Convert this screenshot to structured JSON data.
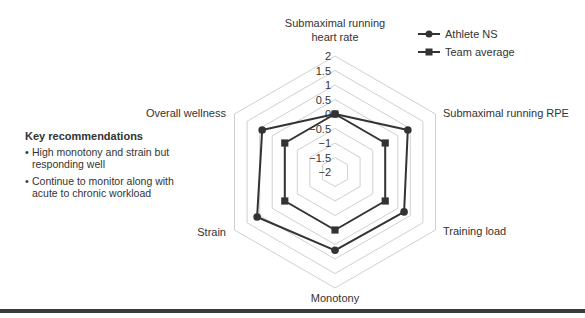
{
  "chart_data": {
    "type": "radar",
    "title": "",
    "axes": [
      "Submaximal running heart rate",
      "Submaximal running RPE",
      "Training load",
      "Monotony",
      "Strain",
      "Overall wellness"
    ],
    "axis_label_lines": [
      [
        "Submaximal running",
        "heart rate"
      ],
      [
        "Submaximal running RPE"
      ],
      [
        "Training load"
      ],
      [
        "Monotony"
      ],
      [
        "Strain"
      ],
      [
        "Overall wellness"
      ]
    ],
    "ticks": [
      "2",
      "1.5",
      "1",
      "0.5",
      "0",
      "−0.5",
      "−1",
      "−1.5",
      "−2"
    ],
    "tick_values": [
      2,
      1.5,
      1,
      0.5,
      0,
      -0.5,
      -1,
      -1.5,
      -2
    ],
    "rlim": [
      -2,
      2
    ],
    "series": [
      {
        "name": "Athlete NS",
        "marker": "circle",
        "values": [
          0,
          0.9,
          0.75,
          0.7,
          1.1,
          0.9
        ]
      },
      {
        "name": "Team average",
        "marker": "square",
        "values": [
          0,
          0,
          0,
          0,
          0,
          0
        ]
      }
    ],
    "legend_position": "top-right",
    "grid": true
  },
  "legend": {
    "items": [
      {
        "label": "Athlete NS",
        "marker": "circle"
      },
      {
        "label": "Team average",
        "marker": "square"
      }
    ]
  },
  "recommendations": {
    "title": "Key recommendations",
    "items": [
      "High monotony and strain but responding well",
      "Continue to monitor along with acute to chronic workload"
    ]
  },
  "colors": {
    "series": "#333333",
    "grid": "#d0d0d0",
    "bar": "#3a3a3a"
  }
}
